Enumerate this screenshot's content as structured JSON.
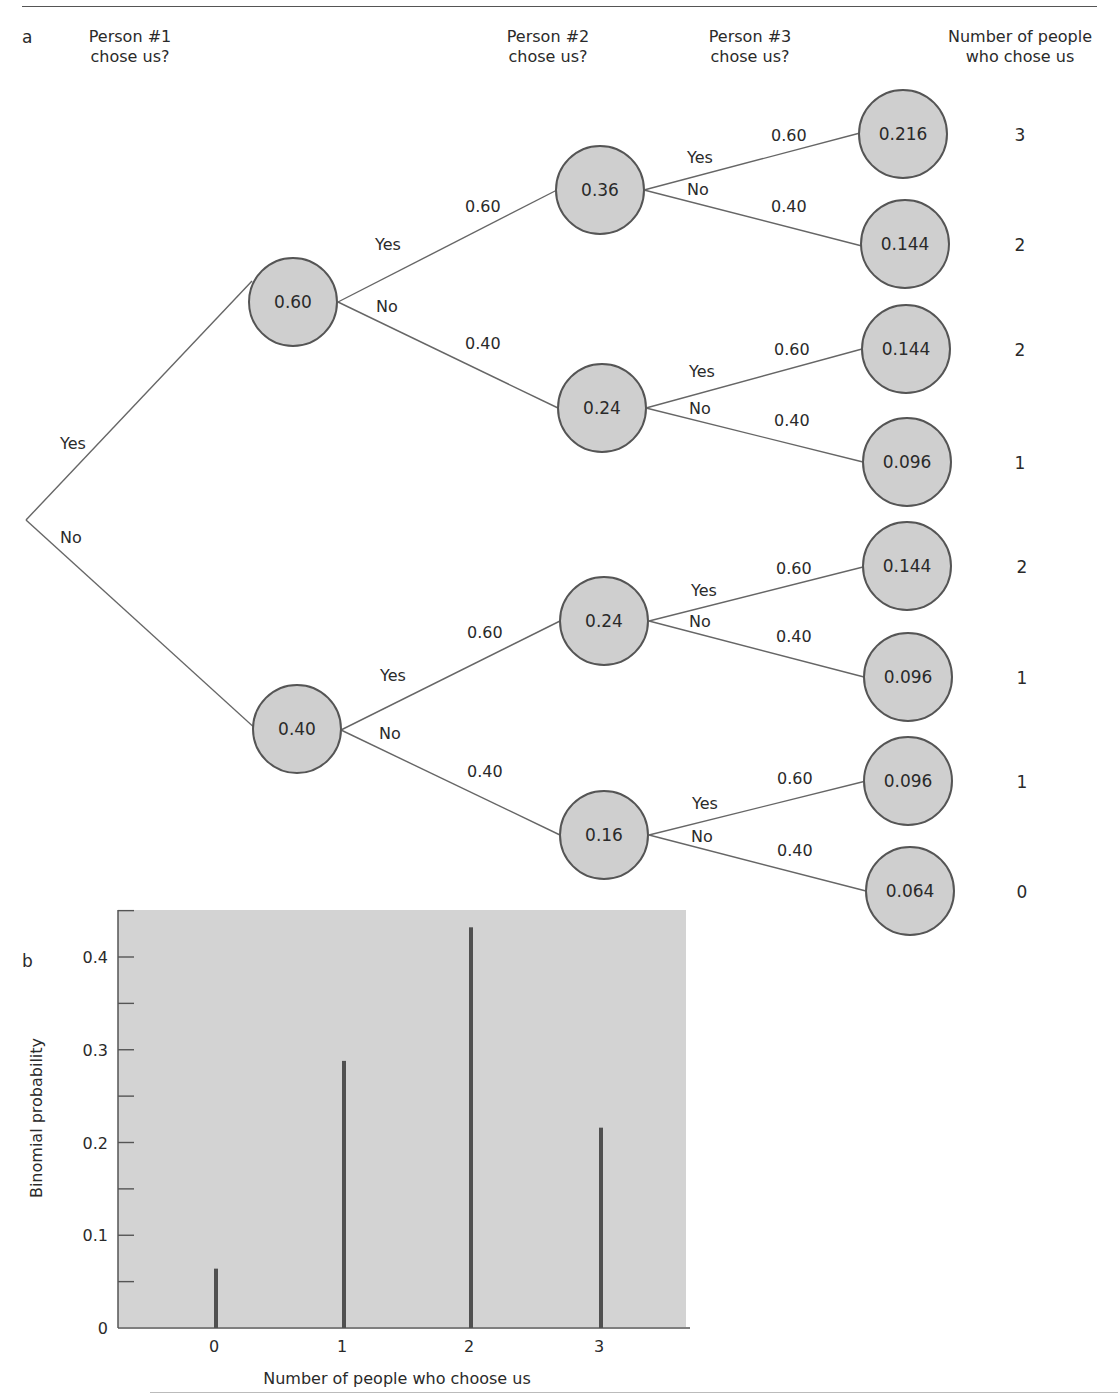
{
  "panel_a": {
    "letter": "a",
    "headers": [
      {
        "line1": "Person #1",
        "line2": "chose us?"
      },
      {
        "line1": "Person #2",
        "line2": "chose us?"
      },
      {
        "line1": "Person #3",
        "line2": "chose us?"
      },
      {
        "line1": "Number of people",
        "line2": "who chose us"
      }
    ],
    "root_branches": {
      "yes": "Yes",
      "no": "No"
    },
    "level1": [
      {
        "value": "0.60",
        "yes": "Yes",
        "no": "No",
        "p_yes": "0.60",
        "p_no": "0.40"
      },
      {
        "value": "0.40",
        "yes": "Yes",
        "no": "No",
        "p_yes": "0.60",
        "p_no": "0.40"
      }
    ],
    "level2": [
      {
        "value": "0.36",
        "yes": "Yes",
        "no": "No",
        "p_yes": "0.60",
        "p_no": "0.40"
      },
      {
        "value": "0.24",
        "yes": "Yes",
        "no": "No",
        "p_yes": "0.60",
        "p_no": "0.40"
      },
      {
        "value": "0.24",
        "yes": "Yes",
        "no": "No",
        "p_yes": "0.60",
        "p_no": "0.40"
      },
      {
        "value": "0.16",
        "yes": "Yes",
        "no": "No",
        "p_yes": "0.60",
        "p_no": "0.40"
      }
    ],
    "leaves": [
      {
        "value": "0.216",
        "count": "3"
      },
      {
        "value": "0.144",
        "count": "2"
      },
      {
        "value": "0.144",
        "count": "2"
      },
      {
        "value": "0.096",
        "count": "1"
      },
      {
        "value": "0.144",
        "count": "2"
      },
      {
        "value": "0.096",
        "count": "1"
      },
      {
        "value": "0.096",
        "count": "1"
      },
      {
        "value": "0.064",
        "count": "0"
      }
    ],
    "colors": {
      "node_fill": "#cfcfcf",
      "node_stroke": "#555555",
      "line": "#666666"
    }
  },
  "panel_b": {
    "letter": "b"
  },
  "chart_data": {
    "type": "bar",
    "title": "",
    "xlabel": "Number of people who choose us",
    "ylabel": "Binomial probability",
    "categories": [
      "0",
      "1",
      "2",
      "3"
    ],
    "values": [
      0.064,
      0.288,
      0.432,
      0.216
    ],
    "ylim": [
      0,
      0.45
    ],
    "yticks": [
      "0",
      "0.1",
      "0.2",
      "0.3",
      "0.4"
    ],
    "minor_ticks_every": 0.05,
    "grid": false,
    "legend": null,
    "background": "#d3d3d3",
    "bar_color": "#505050"
  }
}
